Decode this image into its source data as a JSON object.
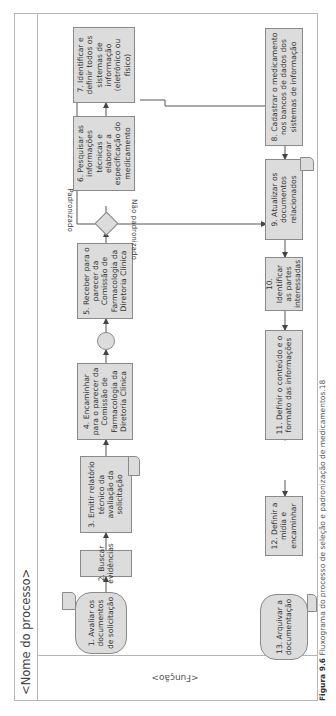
{
  "process": {
    "title": "<Nome do processo>",
    "lane_label": "<Função>"
  },
  "steps": [
    {
      "id": 1,
      "label": "1. Avaliar os documentos de solicitação",
      "shape": "terminal-document"
    },
    {
      "id": 2,
      "label": "2. Buscar evidências",
      "shape": "process"
    },
    {
      "id": 3,
      "label": "3. Emitir relatório técnico da avaliação da solicitação",
      "shape": "process-document"
    },
    {
      "id": 4,
      "label": "4. Encaminhar para o parecer da Comissão de Farmacologia da Diretoria Clínica",
      "shape": "process"
    },
    {
      "id": 5,
      "label": "5. Receber para o parecer da Comissão de Farmacologia da Diretoria Clínica",
      "shape": "process"
    },
    {
      "id": 6,
      "label": "6. Pesquisar as informações técnicas e elaborar a especificação do medicamento",
      "shape": "process"
    },
    {
      "id": 7,
      "label": "7. Identificar e definir todos os sistemas de informação (eletrônico ou físico)",
      "shape": "process"
    },
    {
      "id": 8,
      "label": "8. Cadastrar o medicamento nos bancos de dados dos sistemas de informação",
      "shape": "process"
    },
    {
      "id": 9,
      "label": "9. Atualizar os documentos relacionados",
      "shape": "process-document"
    },
    {
      "id": 10,
      "label": "10. Identificar as partes interessadas",
      "shape": "process"
    },
    {
      "id": 11,
      "label": "11. Definir o conteúdo e o formato das informações",
      "shape": "process"
    },
    {
      "id": 12,
      "label": "12. Definir a mídia e encaminhar",
      "shape": "process"
    },
    {
      "id": 13,
      "label": "13. Arquivar a documentação",
      "shape": "terminal-document"
    }
  ],
  "decision": {
    "yes_label": "Padronizado",
    "no_label": "Não padronizado"
  },
  "caption": {
    "number": "Figura 9.6",
    "text": "Fluxograma do processo de seleção e padronização de medicamentos.18"
  }
}
